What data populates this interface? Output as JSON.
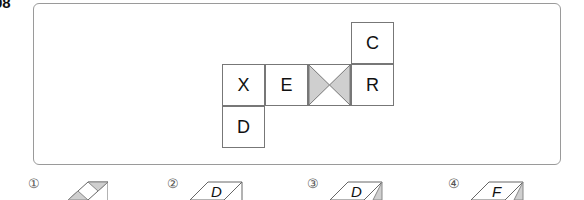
{
  "question_number": "08",
  "net": {
    "cells": [
      {
        "label": "C",
        "col": 3,
        "row": 0
      },
      {
        "label": "X",
        "col": 0,
        "row": 1
      },
      {
        "label": "E",
        "col": 1,
        "row": 1
      },
      {
        "label": "",
        "col": 2,
        "row": 1,
        "pattern": "shaded-hourglass"
      },
      {
        "label": "R",
        "col": 3,
        "row": 1
      },
      {
        "label": "D",
        "col": 0,
        "row": 2
      }
    ],
    "shade_color": "#cfcfcf"
  },
  "options": [
    {
      "marker": "①",
      "face_label": ""
    },
    {
      "marker": "②",
      "face_label": "D"
    },
    {
      "marker": "③",
      "face_label": "D"
    },
    {
      "marker": "④",
      "face_label": "F"
    }
  ]
}
